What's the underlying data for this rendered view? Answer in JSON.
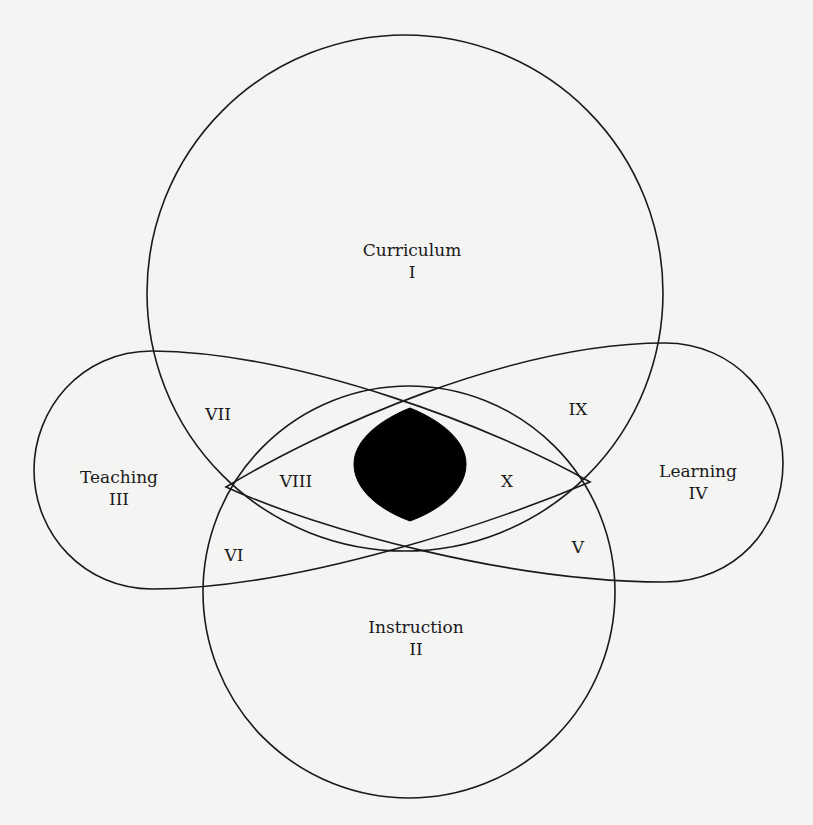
{
  "diagram": {
    "sets": [
      {
        "id": "curriculum",
        "name": "Curriculum",
        "numeral": "I"
      },
      {
        "id": "instruction",
        "name": "Instruction",
        "numeral": "II"
      },
      {
        "id": "teaching",
        "name": "Teaching",
        "numeral": "III"
      },
      {
        "id": "learning",
        "name": "Learning",
        "numeral": "IV"
      }
    ],
    "regions": {
      "v": "V",
      "vi": "VI",
      "vii": "VII",
      "viii": "VIII",
      "ix": "IX",
      "x": "X"
    },
    "colors": {
      "background": "#f4f4f2",
      "stroke": "#1a1a1a",
      "center_fill": "#000000"
    }
  }
}
